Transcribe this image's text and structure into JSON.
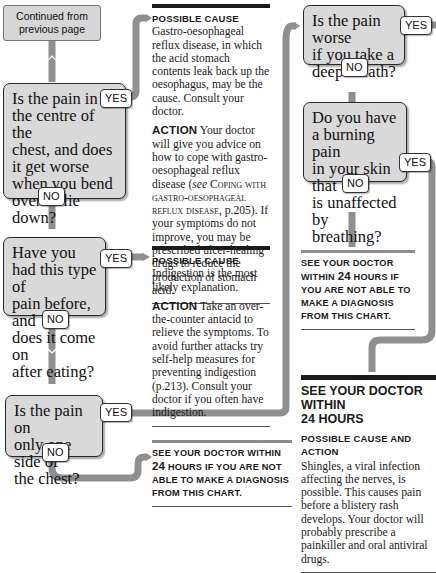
{
  "colors": {
    "connector": "#8f8f8f",
    "question_fill": "#d9d9d9",
    "rule_dark": "#1a1a1a",
    "rule_grey": "#8c8c8c"
  },
  "continued": {
    "line1": "Continued from",
    "line2": "previous page"
  },
  "questions": [
    {
      "id": "centre-chest",
      "lines": [
        "Is the pain in",
        "the centre of the",
        "chest, and does",
        "it get worse",
        "when you bend",
        "over or lie",
        "down?"
      ],
      "yes": "YES",
      "no": "NO"
    },
    {
      "id": "had-before",
      "lines": [
        "Have you",
        "had this type of",
        "pain before, and",
        "does it come on",
        "after eating?"
      ],
      "yes": "YES",
      "no": "NO"
    },
    {
      "id": "one-side",
      "lines": [
        "Is the pain on",
        "only one side of",
        "the chest?"
      ],
      "yes": "YES",
      "no": "NO"
    },
    {
      "id": "deep-breath",
      "lines": [
        "Is the pain worse",
        "if you take a",
        "deep breath?"
      ],
      "yes": "YES",
      "no": "NO"
    },
    {
      "id": "burning-skin",
      "lines": [
        "Do you have",
        "a burning pain",
        "in your skin that",
        "is unaffected by",
        "breathing?"
      ],
      "yes": "YES",
      "no": "NO"
    }
  ],
  "outcomes": {
    "gerd": {
      "cause_label": "Possible cause",
      "cause_text": "Gastro-oesophageal reflux disease, in which the acid stomach contents leak back up the oesophagus, may be the cause. Consult your doctor.",
      "action_label": "Action",
      "action_text_1": "Your doctor will give you advice on how to cope with gastro-oesophageal reflux disease (",
      "see": "see",
      "ref_title": "Coping with gastro-oesophageal reflux disease",
      "action_text_2": ", p.205). If your symptoms do not improve, you may be prescribed ulcer-healing drugs to reduce the production of stomach acid."
    },
    "indigestion": {
      "cause_label": "Possible cause",
      "cause_text": "Indigestion is the most likely explanation.",
      "action_label": "Action",
      "action_text": "Take an over-the-counter antacid to relieve the symptoms. To avoid further attacks try self-help measures for preventing indigestion (p.213). Consult your doctor if you often have indigestion."
    },
    "see_doctor_bottom": {
      "pre": "See your doctor within",
      "num": "24",
      "post": "hours if you are not able to make a diagnosis from this chart."
    },
    "see_doctor_right": {
      "pre": "See your doctor within",
      "num": "24",
      "post": "hours if you are not able to make a diagnosis from this chart."
    },
    "shingles": {
      "heading_1": "SEE YOUR DOCTOR WITHIN",
      "heading_2": "24 HOURS",
      "label": "Possible cause and action",
      "text": "Shingles, a viral infection affecting the nerves, is possible. This causes pain before a blistery rash develops. Your doctor will probably prescribe a painkiller and oral antiviral drugs."
    }
  }
}
